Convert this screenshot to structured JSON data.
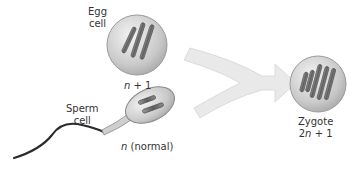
{
  "egg": {
    "label_line1": "Egg",
    "label_line2": "cell",
    "ploidy_var": "n",
    "ploidy_rest": " + 1"
  },
  "sperm": {
    "label_line1": "Sperm",
    "label_line2": "cell",
    "ploidy_var": "n",
    "ploidy_rest": " (normal)"
  },
  "zygote": {
    "label": "Zygote",
    "ploidy_prefix": "2",
    "ploidy_var": "n",
    "ploidy_rest": " + 1"
  },
  "colors": {
    "arrow": "#e8e8e8",
    "cell_fill": "#cfcfcf",
    "chromosome": "#6b6b6b",
    "text": "#333333"
  }
}
